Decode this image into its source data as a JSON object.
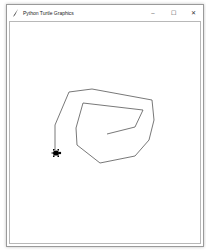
{
  "window": {
    "title": "Python Turtle Graphics",
    "icon": "feather-icon",
    "controls": {
      "minimize": "–",
      "maximize": "☐",
      "close": "✕"
    }
  },
  "canvas": {
    "background": "#ffffff",
    "pen_color": "#555555",
    "turtle_color": "#000000",
    "path_points": [
      [
        55,
        150
      ],
      [
        55,
        125
      ],
      [
        69,
        92
      ],
      [
        92,
        89
      ],
      [
        152,
        100
      ],
      [
        154,
        120
      ],
      [
        149,
        140
      ],
      [
        135,
        156
      ],
      [
        100,
        163
      ],
      [
        77,
        145
      ],
      [
        76,
        128
      ],
      [
        83,
        103
      ],
      [
        143,
        110
      ],
      [
        135,
        127
      ],
      [
        107,
        134
      ]
    ],
    "turtle": {
      "x": 56,
      "y": 153,
      "heading": "east"
    }
  }
}
